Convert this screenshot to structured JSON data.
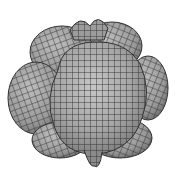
{
  "figure": {
    "background": "#ffffff",
    "surface_color": "#a9a9a9",
    "surface_highlight": "#c4c4c4",
    "surface_shadow": "#7c7c7c",
    "grid_color": "#2e2e2e",
    "lobes": [
      {
        "name": "top-left",
        "cx": 62,
        "cy": 52,
        "rx": 32,
        "ry": 26
      },
      {
        "name": "top-right",
        "cx": 112,
        "cy": 46,
        "rx": 30,
        "ry": 24
      },
      {
        "name": "left",
        "cx": 36,
        "cy": 98,
        "rx": 28,
        "ry": 36
      },
      {
        "name": "right",
        "cx": 148,
        "cy": 88,
        "rx": 20,
        "ry": 32
      },
      {
        "name": "bottom-left",
        "cx": 60,
        "cy": 140,
        "rx": 28,
        "ry": 18
      },
      {
        "name": "bottom-right",
        "cx": 120,
        "cy": 138,
        "rx": 32,
        "ry": 20
      },
      {
        "name": "center",
        "cx": 96,
        "cy": 96,
        "rx": 52,
        "ry": 56
      }
    ]
  }
}
